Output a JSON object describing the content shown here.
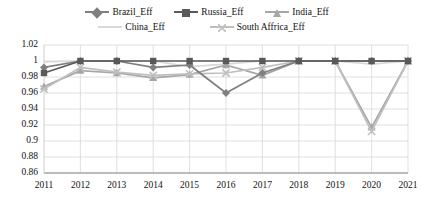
{
  "chart_data": {
    "type": "line",
    "title": "",
    "xlabel": "",
    "ylabel": "",
    "categories": [
      "2011",
      "2012",
      "2013",
      "2014",
      "2015",
      "2016",
      "2017",
      "2018",
      "2019",
      "2020",
      "2021"
    ],
    "ylim": [
      0.86,
      1.02
    ],
    "yticks": [
      "1.02",
      "1",
      "0.98",
      "0.96",
      "0.94",
      "0.92",
      "0.9",
      "0.88",
      "0.86"
    ],
    "ytick_values": [
      1.02,
      1.0,
      0.98,
      0.96,
      0.94,
      0.92,
      0.9,
      0.88,
      0.86
    ],
    "grid": true,
    "legend_position": "top",
    "series": [
      {
        "name": "Brazil_Eff",
        "marker": "diamond",
        "color": "#7f7f7f",
        "values": [
          0.992,
          1.0,
          1.0,
          0.992,
          0.995,
          0.96,
          0.985,
          1.0,
          1.0,
          1.0,
          1.0
        ]
      },
      {
        "name": "Russia_Eff",
        "marker": "square",
        "color": "#595959",
        "values": [
          0.985,
          1.0,
          1.0,
          1.0,
          1.0,
          1.0,
          1.0,
          1.0,
          1.0,
          1.0,
          1.0
        ]
      },
      {
        "name": "India_Eff",
        "marker": "triangle",
        "color": "#a6a6a6",
        "values": [
          0.968,
          0.988,
          0.985,
          0.979,
          0.983,
          0.995,
          0.982,
          1.0,
          1.0,
          0.917,
          1.0
        ]
      },
      {
        "name": "China_Eff",
        "marker": "line",
        "color": "#d9d9d9",
        "values": [
          0.999,
          1.0,
          1.0,
          1.0,
          0.993,
          0.996,
          1.0,
          1.0,
          1.0,
          0.996,
          1.0
        ]
      },
      {
        "name": "South Affrica_Eff",
        "marker": "cross",
        "color": "#bfbfbf",
        "values": [
          0.965,
          0.992,
          0.986,
          0.982,
          0.984,
          0.985,
          0.992,
          1.0,
          1.0,
          0.912,
          1.0
        ]
      }
    ]
  },
  "legend": {
    "items": [
      {
        "label": "Brazil_Eff"
      },
      {
        "label": "Russia_Eff"
      },
      {
        "label": "India_Eff"
      },
      {
        "label": "China_Eff"
      },
      {
        "label": "South Affrica_Eff"
      }
    ]
  }
}
